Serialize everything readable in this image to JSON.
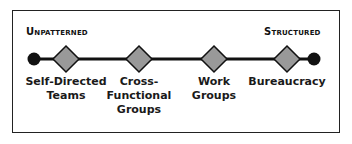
{
  "diagram": {
    "left_pole": "Unpatterned",
    "right_pole": "Structured",
    "colors": {
      "line": "#111111",
      "diamond_fill": "#999999",
      "diamond_stroke": "#111111",
      "endpoint": "#111111",
      "border": "#222222"
    },
    "nodes": [
      {
        "lines": [
          "Self-Directed",
          "Teams"
        ],
        "x": 66
      },
      {
        "lines": [
          "Cross-",
          "Functional",
          "Groups"
        ],
        "x": 139
      },
      {
        "lines": [
          "Work",
          "Groups"
        ],
        "x": 214
      },
      {
        "lines": [
          "Bureaucracy"
        ],
        "x": 287
      }
    ]
  }
}
